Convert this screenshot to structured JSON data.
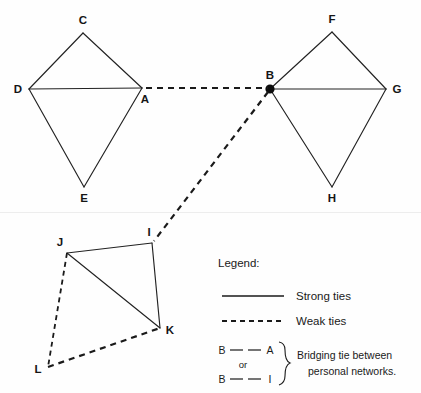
{
  "diagram": {
    "background_color": "#fefefe",
    "ink_color": "#1a1a1a",
    "networks": [
      {
        "name": "left-personal-network",
        "nodes": [
          {
            "id": "C",
            "label": "C",
            "x": 83,
            "y": 33,
            "label_x": 83,
            "label_y": 24,
            "marker": "none"
          },
          {
            "id": "D",
            "label": "D",
            "x": 29,
            "y": 89,
            "label_x": 18,
            "label_y": 93,
            "marker": "none"
          },
          {
            "id": "A",
            "label": "A",
            "x": 142,
            "y": 88,
            "label_x": 145,
            "label_y": 103,
            "marker": "none"
          },
          {
            "id": "E",
            "label": "E",
            "x": 84,
            "y": 187,
            "label_x": 84,
            "label_y": 202,
            "marker": "none"
          }
        ]
      },
      {
        "name": "right-personal-network",
        "nodes": [
          {
            "id": "F",
            "label": "F",
            "x": 332,
            "y": 32,
            "label_x": 332,
            "label_y": 23,
            "marker": "none"
          },
          {
            "id": "B",
            "label": "B",
            "x": 270,
            "y": 89,
            "label_x": 270,
            "label_y": 79,
            "marker": "dot"
          },
          {
            "id": "G",
            "label": "G",
            "x": 386,
            "y": 89,
            "label_x": 397,
            "label_y": 93,
            "marker": "none"
          },
          {
            "id": "H",
            "label": "H",
            "x": 332,
            "y": 187,
            "label_x": 332,
            "label_y": 202,
            "marker": "none"
          }
        ]
      },
      {
        "name": "lower-personal-network",
        "nodes": [
          {
            "id": "J",
            "label": "J",
            "x": 67,
            "y": 253,
            "label_x": 60,
            "label_y": 246,
            "marker": "none"
          },
          {
            "id": "I",
            "label": "I",
            "x": 152,
            "y": 243,
            "label_x": 149,
            "label_y": 236,
            "marker": "none"
          },
          {
            "id": "K",
            "label": "K",
            "x": 160,
            "y": 328,
            "label_x": 170,
            "label_y": 334,
            "marker": "none"
          },
          {
            "id": "L",
            "label": "L",
            "x": 48,
            "y": 367,
            "label_x": 38,
            "label_y": 373,
            "marker": "none"
          }
        ]
      }
    ],
    "edges": [
      {
        "from": "D",
        "to": "C",
        "tie": "strong"
      },
      {
        "from": "C",
        "to": "A",
        "tie": "strong"
      },
      {
        "from": "D",
        "to": "A",
        "tie": "strong"
      },
      {
        "from": "D",
        "to": "E",
        "tie": "strong"
      },
      {
        "from": "E",
        "to": "A",
        "tie": "strong"
      },
      {
        "from": "B",
        "to": "F",
        "tie": "strong"
      },
      {
        "from": "F",
        "to": "G",
        "tie": "strong"
      },
      {
        "from": "B",
        "to": "G",
        "tie": "strong"
      },
      {
        "from": "B",
        "to": "H",
        "tie": "strong"
      },
      {
        "from": "H",
        "to": "G",
        "tie": "strong"
      },
      {
        "from": "J",
        "to": "I",
        "tie": "strong"
      },
      {
        "from": "J",
        "to": "K",
        "tie": "strong"
      },
      {
        "from": "I",
        "to": "K",
        "tie": "strong"
      },
      {
        "from": "A",
        "to": "B",
        "tie": "weak"
      },
      {
        "from": "B",
        "to": "I",
        "tie": "weak"
      },
      {
        "from": "J",
        "to": "L",
        "tie": "weak"
      },
      {
        "from": "L",
        "to": "K",
        "tie": "weak"
      }
    ]
  },
  "legend": {
    "heading": "Legend:",
    "entries": [
      {
        "id": "strong",
        "sample": "solid-line",
        "label": "Strong ties"
      },
      {
        "id": "weak",
        "sample": "dashed-line",
        "label": "Weak ties"
      }
    ],
    "bridging": {
      "row_one_left": "B",
      "row_one_right": "A",
      "connector": "or",
      "row_two_left": "B",
      "row_two_right": "I",
      "description_line_one": "Bridging tie between",
      "description_line_two": "personal networks."
    }
  }
}
